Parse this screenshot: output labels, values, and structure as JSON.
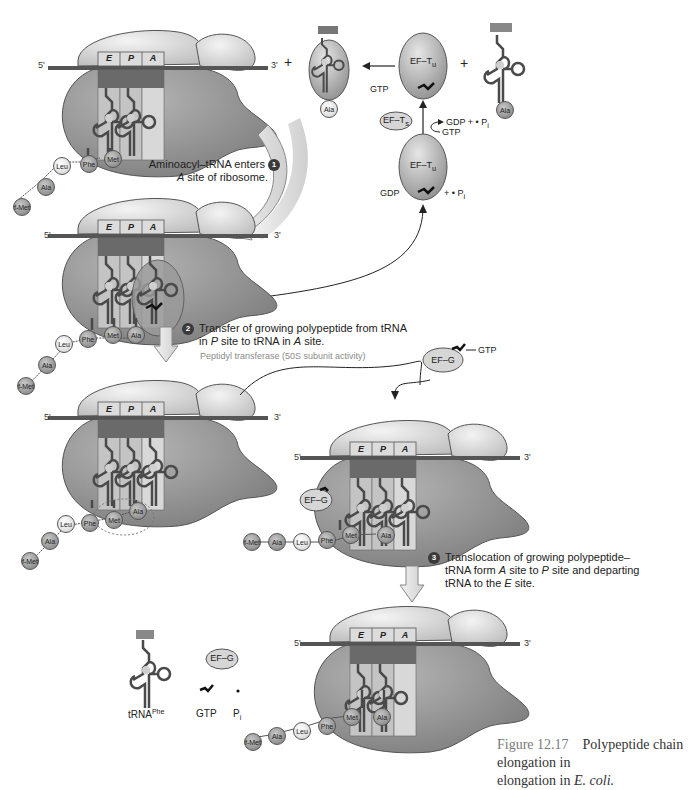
{
  "figure": {
    "number": "Figure 12.17",
    "title": "Polypeptide chain elongation in",
    "organism": "E. coli."
  },
  "sites": {
    "e": "E",
    "p": "P",
    "a": "A"
  },
  "mrna": {
    "five_prime": "5'",
    "three_prime": "3'"
  },
  "steps": [
    {
      "num": "1",
      "line1": "Aminoacyl–tRNA enters",
      "line2_italic": "A",
      "line2": " site of ribosome."
    },
    {
      "num": "2",
      "line1": "Transfer of growing polypeptide from tRNA",
      "line2_pre": "in ",
      "line2_italic1": "P",
      "line2_mid": " site to tRNA in ",
      "line2_italic2": "A",
      "line2_post": " site.",
      "note": "Peptidyl transferase (50S subunit activity)"
    },
    {
      "num": "3",
      "line1": "Translocation of growing polypeptide–",
      "line2_pre": "tRNA form ",
      "line2_italic1": "A",
      "line2_mid": " site to ",
      "line2_italic2": "P",
      "line2_post": " site and departing",
      "line3_pre": "tRNA to the ",
      "line3_italic": "E",
      "line3_post": " site."
    }
  ],
  "factors": {
    "ef_tu": "EF–T",
    "ef_tu_sub": "u",
    "ef_ts": "EF–T",
    "ef_ts_sub": "s",
    "ef_g": "EF–G",
    "gtp": "GTP",
    "gdp": "GDP",
    "gdp_pi": "GDP + • P",
    "pi_plus": "+ • P",
    "pi_sub": "i",
    "pi": "P"
  },
  "amino_acids": {
    "fmet": "f-Met",
    "ala": "Ala",
    "leu": "Leu",
    "phe": "Phe",
    "met": "Met"
  },
  "released": {
    "trna": "tRNA",
    "trna_sup": "Phe",
    "gtp": "GTP",
    "pi": "P",
    "pi_sub": "i"
  },
  "plus": "+",
  "colors": {
    "ribosome_small": "#d6d6d6",
    "ribosome_large": "#8f8f8f",
    "mrna": "#555555",
    "trna": "#4a4a4a",
    "arrow_fill": "#e4e4e4"
  }
}
